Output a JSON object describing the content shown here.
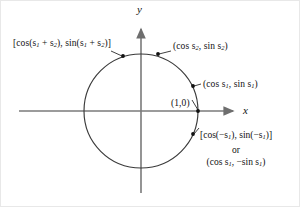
{
  "figure": {
    "type": "unit-circle-diagram",
    "background_color": "#ffffff",
    "stroke_color": "#3a3a3a",
    "axis_color": "#6e6e6e",
    "text_color": "#111111"
  },
  "axes": {
    "x_label": "x",
    "y_label": "y",
    "origin": {
      "x": 140,
      "y": 110
    },
    "x_axis": {
      "x1": 18,
      "y1": 110,
      "x2": 238,
      "y2": 110,
      "arrow": "right"
    },
    "y_axis": {
      "x1": 140,
      "y1": 190,
      "x2": 140,
      "y2": 22,
      "arrow": "up"
    }
  },
  "circle": {
    "center_x": 140,
    "center_y": 110,
    "radius": 57,
    "name": "unit-circle"
  },
  "points": [
    {
      "id": "sum-point",
      "label": "[cos(s<sub>1</sub> + s<sub>2</sub>), sin(s<sub>1</sub> + s<sub>2</sub>)]",
      "label_plain": "[cos(s1 + s2), sin(s1 + s2)]",
      "dot": {
        "x": 122,
        "y": 55
      },
      "label_pos": {
        "x": 12,
        "y": 37
      }
    },
    {
      "id": "s2-point",
      "label": "(cos s<sub>2</sub>, sin s<sub>2</sub>)",
      "label_plain": "(cos s2, sin s2)",
      "dot": {
        "x": 157,
        "y": 53
      },
      "label_pos": {
        "x": 172,
        "y": 40
      }
    },
    {
      "id": "s1-point",
      "label": "(cos s<sub>1</sub>, sin s<sub>1</sub>)",
      "label_plain": "(cos s1, sin s1)",
      "dot": {
        "x": 192,
        "y": 85
      },
      "label_pos": {
        "x": 202,
        "y": 78
      }
    },
    {
      "id": "one-zero-point",
      "label": "(1,0)",
      "label_plain": "(1,0)",
      "dot": {
        "x": 197,
        "y": 110
      },
      "label_pos": {
        "x": 170,
        "y": 97
      }
    },
    {
      "id": "negative-s1-point",
      "label": "[cos(&minus;s<sub>1</sub>), sin(&minus;s<sub>1</sub>)]",
      "label_plain": "[cos(-s1), sin(-s1)]",
      "dot": {
        "x": 192,
        "y": 133
      },
      "label_pos": {
        "x": 199,
        "y": 130
      }
    }
  ],
  "negative_angle_note": {
    "line1": "[cos(&minus;s<sub>1</sub>), sin(&minus;s<sub>1</sub>)]",
    "line2": "or",
    "line3": "(cos s<sub>1</sub>, &minus;sin s<sub>1</sub>)",
    "line1_plain": "[cos(-s1), sin(-s1)]",
    "line2_plain": "or",
    "line3_plain": "(cos s1, -sin s1)"
  },
  "origin_label": "(1,0)"
}
